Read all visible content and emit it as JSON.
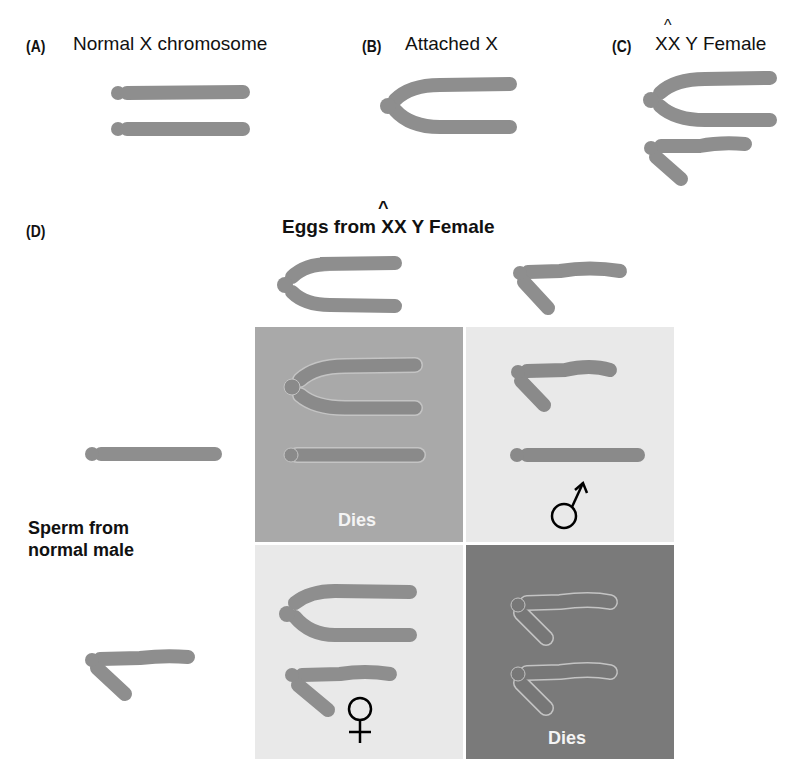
{
  "colors": {
    "chromosome": "#8e8e8e",
    "chromosome_dark": "#7d7d7d",
    "cell_dies_top": "#a9a9a9",
    "cell_male": "#e9e9e9",
    "cell_female": "#e9e9e9",
    "cell_dies_bottom": "#7a7a7a",
    "outline": "#c8c8c8"
  },
  "panels": {
    "A": {
      "letter": "(A)",
      "title": "Normal X chromosome"
    },
    "B": {
      "letter": "(B)",
      "title": "Attached X"
    },
    "C": {
      "letter": "(C)",
      "title_hat": "^",
      "title": "XX Y Female"
    },
    "D": {
      "letter": "(D)"
    }
  },
  "punnett": {
    "column_header": "Eggs from XX Y Female",
    "column_header_hat": "^",
    "row_header_line1": "Sperm from",
    "row_header_line2": "normal male",
    "eggs": [
      "attached-X",
      "Y"
    ],
    "sperm": [
      "X",
      "Y"
    ],
    "cells": [
      {
        "row": 0,
        "col": 0,
        "contents": [
          "attached-X",
          "X"
        ],
        "outcome": "Dies"
      },
      {
        "row": 0,
        "col": 1,
        "contents": [
          "Y",
          "X"
        ],
        "outcome": "male",
        "symbol": "♂"
      },
      {
        "row": 1,
        "col": 0,
        "contents": [
          "attached-X",
          "Y"
        ],
        "outcome": "female",
        "symbol": "♀"
      },
      {
        "row": 1,
        "col": 1,
        "contents": [
          "Y",
          "Y"
        ],
        "outcome": "Dies"
      }
    ]
  }
}
